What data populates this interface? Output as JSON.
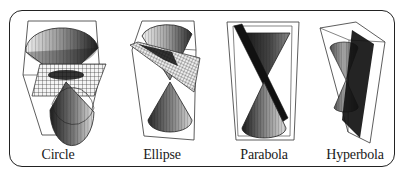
{
  "figure": {
    "type": "conic-sections-diagram",
    "panels": [
      {
        "id": "circle",
        "label": "Circle",
        "plane": "horizontal (perpendicular to cone axis)"
      },
      {
        "id": "ellipse",
        "label": "Ellipse",
        "plane": "tilted, cutting one nappe"
      },
      {
        "id": "parabola",
        "label": "Parabola",
        "plane": "parallel to a generator line"
      },
      {
        "id": "hyperbola",
        "label": "Hyperbola",
        "plane": "vertical, cutting both nappes"
      }
    ]
  },
  "colors": {
    "frame": "#222222",
    "cone_dark": "#2a2a2a",
    "cone_mid": "#8a8a8a",
    "cone_light": "#d8d8d8",
    "plane_grid": "#444444",
    "background": "#ffffff"
  }
}
